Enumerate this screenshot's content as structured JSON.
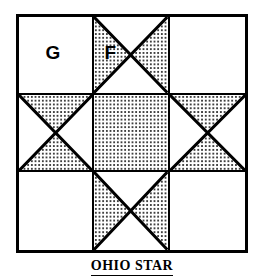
{
  "figure": {
    "title": "OHIO STAR",
    "caption": "OHIO STAR",
    "block_type": "quilt-block",
    "grid": {
      "rows": 3,
      "cols": 3
    },
    "colors": {
      "line": "#000000",
      "background": "#ffffff",
      "fill_pattern": "dotted",
      "dot_color": "#000000"
    },
    "cells": [
      {
        "position": "top-left",
        "pattern": "plain",
        "label": "G"
      },
      {
        "position": "top-center",
        "pattern": "hourglass-horizontal",
        "label": "F"
      },
      {
        "position": "top-right",
        "pattern": "plain",
        "label": ""
      },
      {
        "position": "middle-left",
        "pattern": "hourglass-vertical",
        "label": ""
      },
      {
        "position": "center",
        "pattern": "solid-dotted",
        "label": ""
      },
      {
        "position": "middle-right",
        "pattern": "hourglass-vertical",
        "label": ""
      },
      {
        "position": "bottom-left",
        "pattern": "plain",
        "label": ""
      },
      {
        "position": "bottom-center",
        "pattern": "hourglass-horizontal",
        "label": ""
      },
      {
        "position": "bottom-right",
        "pattern": "plain",
        "label": ""
      }
    ],
    "labels": {
      "corner_patch": "G",
      "star_point_patch": "F"
    }
  }
}
